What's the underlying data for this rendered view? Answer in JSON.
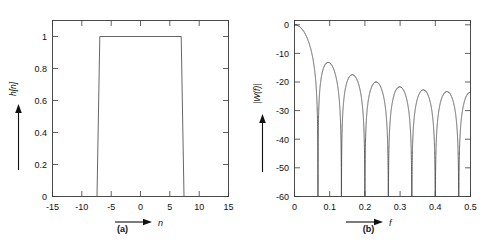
{
  "figure": {
    "panels": [
      {
        "id": "a",
        "caption": "(a)",
        "xlabel": "n",
        "ylabel": "h[n]"
      },
      {
        "id": "b",
        "caption": "(b)",
        "xlabel": "f",
        "ylabel": "|W(f)|"
      }
    ]
  },
  "chart_data": [
    {
      "type": "line",
      "panel": "(a)",
      "title": "",
      "xlabel": "n",
      "ylabel": "h[n]",
      "xlim": [
        -15,
        15
      ],
      "ylim": [
        0,
        1.1
      ],
      "xticks": [
        -15,
        -10,
        -5,
        0,
        5,
        10,
        15
      ],
      "xticklabels": [
        "-15",
        "-10",
        "-5",
        "0",
        "5",
        "10",
        "15"
      ],
      "yticks": [
        0,
        0.2,
        0.4,
        0.6,
        0.8,
        1
      ],
      "yticklabels": [
        "0",
        "0.2",
        "0.4",
        "0.6",
        "0.8",
        "1"
      ],
      "grid": false,
      "legend": null,
      "description": "Rectangular window sequence of length 15 samples, zero outside",
      "x": [
        -11.5,
        -7.8,
        -7.3,
        7.3,
        7.8,
        11.5
      ],
      "y": [
        0,
        0,
        1,
        1,
        0,
        0
      ]
    },
    {
      "type": "line",
      "panel": "(b)",
      "title": "",
      "xlabel": "f",
      "ylabel": "|W(f)|",
      "xlim": [
        0,
        0.5
      ],
      "ylim": [
        -60,
        1.5
      ],
      "xticks": [
        0,
        0.1,
        0.2,
        0.3,
        0.4,
        0.5
      ],
      "xticklabels": [
        "0",
        "0.1",
        "0.2",
        "0.3",
        "0.4",
        "0.5"
      ],
      "yticks": [
        0,
        -10,
        -20,
        -30,
        -40,
        -50,
        -60
      ],
      "yticklabels": [
        "0",
        "-10",
        "-20",
        "-30",
        "-40",
        "-50",
        "-60"
      ],
      "grid": false,
      "legend": null,
      "description": "Magnitude spectrum in dB of a 15-point rectangular window (Dirichlet kernel), nulls at multiples of 1/15",
      "window_length": 15,
      "mainlobe_peak_db": 0,
      "nulls_f": [
        0.0667,
        0.1333,
        0.2,
        0.2667,
        0.3333,
        0.4,
        0.4667
      ],
      "sidelobe_peaks_f": [
        0.1,
        0.1667,
        0.2333,
        0.3,
        0.3667,
        0.4333,
        0.5
      ],
      "sidelobe_peaks_db": [
        -13.3,
        -17.8,
        -20.8,
        -22.2,
        -23.0,
        -23.3,
        -23.6
      ],
      "null_depth_db": [
        -48,
        -49,
        -60,
        -59,
        -60,
        -60,
        -59
      ]
    }
  ]
}
